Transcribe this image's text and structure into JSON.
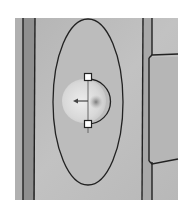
{
  "viewport": {
    "kind": "cad-3d-view",
    "bounds": {
      "x": 15,
      "y": 18,
      "width": 163,
      "height": 182
    }
  },
  "colors": {
    "background": "#ffffff",
    "surface_light": "#bdbdbd",
    "surface_mid": "#a9a9a9",
    "surface_dark": "#8f8f8f",
    "edge": "#222222",
    "sphere_highlight": "#e6e6e6",
    "sphere_core": "#8a8a8a"
  },
  "geometry": {
    "ellipse": {
      "cx": 88,
      "cy": 102,
      "rx": 35,
      "ry": 83
    },
    "sphere": {
      "cx": 85,
      "cy": 101,
      "r": 22
    },
    "handle_top": {
      "x": 88,
      "y": 77
    },
    "handle_bottom": {
      "x": 88,
      "y": 124
    },
    "panel": {
      "x": 152,
      "y": 55,
      "width": 26,
      "height": 106
    }
  },
  "icons": {
    "gizmo": "move-axis-gizmo-icon",
    "handles": "drag-handle-icon"
  }
}
